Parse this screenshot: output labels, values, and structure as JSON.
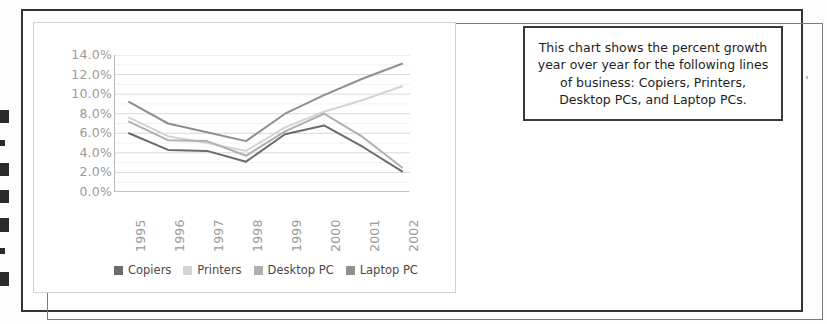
{
  "caption": {
    "text": "This chart shows the percent growth year over year for the following lines of business: Copiers, Printers, Desktop PCs, and Laptop PCs."
  },
  "chart_data": {
    "type": "line",
    "title": "",
    "xlabel": "",
    "ylabel": "",
    "categories": [
      "1995",
      "1996",
      "1997",
      "1998",
      "1999",
      "2000",
      "2001",
      "2002"
    ],
    "ylim": [
      0,
      14
    ],
    "ytick_labels": [
      "14.0%",
      "12.0%",
      "10.0%",
      "8.0%",
      "6.0%",
      "4.0%",
      "2.0%",
      "0.0%"
    ],
    "ytick_values": [
      14,
      12,
      10,
      8,
      6,
      4,
      2,
      0
    ],
    "grid": true,
    "legend_position": "bottom",
    "series": [
      {
        "name": "Copiers",
        "color": "#6b6b6b",
        "values": [
          6.0,
          4.3,
          4.2,
          3.1,
          5.9,
          6.8,
          4.6,
          2.1
        ]
      },
      {
        "name": "Printers",
        "color": "#d4d4d4",
        "values": [
          7.6,
          5.7,
          5.0,
          4.2,
          6.6,
          8.2,
          9.4,
          10.8
        ]
      },
      {
        "name": "Desktop PC",
        "color": "#b0b0b0",
        "values": [
          7.2,
          5.3,
          5.2,
          3.7,
          6.2,
          8.0,
          5.6,
          2.5
        ]
      },
      {
        "name": "Laptop PC",
        "color": "#8f8f8f",
        "values": [
          9.2,
          7.0,
          6.1,
          5.2,
          8.0,
          9.9,
          11.6,
          13.1
        ]
      }
    ]
  },
  "legend": {
    "items": [
      {
        "label": "Copiers",
        "color": "#6b6b6b"
      },
      {
        "label": "Printers",
        "color": "#d4d4d4"
      },
      {
        "label": "Desktop PC",
        "color": "#b0b0b0"
      },
      {
        "label": "Laptop PC",
        "color": "#8f8f8f"
      }
    ]
  }
}
